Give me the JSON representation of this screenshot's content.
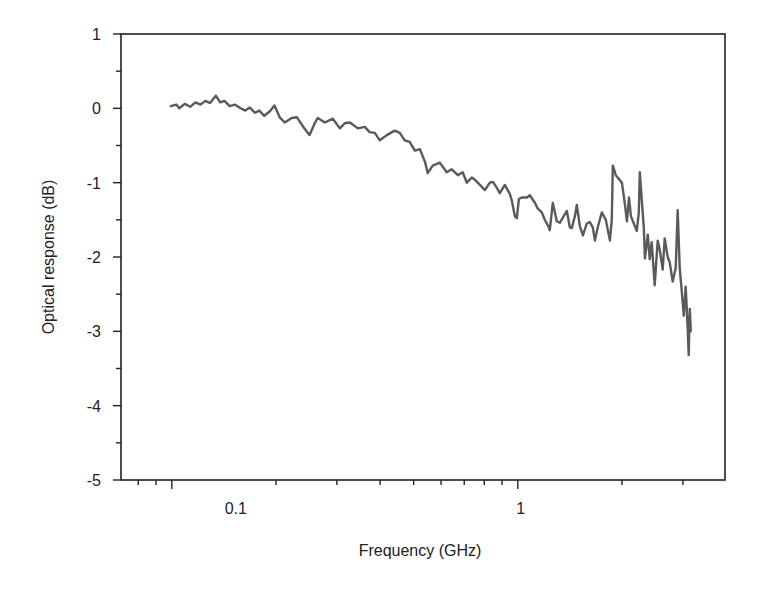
{
  "chart_data": {
    "type": "line",
    "title": "",
    "xlabel": "Frequency (GHz)",
    "ylabel": "Optical response (dB)",
    "xscale": "log",
    "xlim": [
      0.0713,
      3.97
    ],
    "ylim": [
      -5,
      1
    ],
    "grid": false,
    "legend": "none",
    "x_tick_labels": [
      {
        "value": 0.1,
        "label": "0.1"
      },
      {
        "value": 1,
        "label": "1"
      }
    ],
    "x_minor_ticks": [
      0.08,
      0.09,
      0.2,
      0.3,
      0.4,
      0.5,
      0.6,
      0.7,
      0.8,
      0.9,
      2,
      3
    ],
    "y_ticks": [
      1,
      0,
      -1,
      -2,
      -3,
      -4,
      -5
    ],
    "y_tick_labels": [
      "1",
      "0",
      "-1",
      "-2",
      "-3",
      "-4",
      "-5"
    ],
    "y_minor_ticks": [
      0.5,
      -0.5,
      -1.5,
      -2.5,
      -3.5,
      -4.5
    ],
    "line_color": "#5a5a5a",
    "series": [
      {
        "name": "Optical response",
        "points": [
          [
            0.0994,
            0.03
          ],
          [
            0.103,
            0.05
          ],
          [
            0.105,
            0.0
          ],
          [
            0.109,
            0.06
          ],
          [
            0.113,
            0.02
          ],
          [
            0.117,
            0.08
          ],
          [
            0.121,
            0.05
          ],
          [
            0.125,
            0.1
          ],
          [
            0.129,
            0.07
          ],
          [
            0.134,
            0.17
          ],
          [
            0.138,
            0.08
          ],
          [
            0.142,
            0.1
          ],
          [
            0.147,
            0.03
          ],
          [
            0.152,
            0.05
          ],
          [
            0.158,
            0.0
          ],
          [
            0.163,
            -0.03
          ],
          [
            0.168,
            0.01
          ],
          [
            0.174,
            -0.06
          ],
          [
            0.179,
            -0.03
          ],
          [
            0.185,
            -0.1
          ],
          [
            0.192,
            -0.04
          ],
          [
            0.198,
            0.04
          ],
          [
            0.205,
            -0.12
          ],
          [
            0.212,
            -0.19
          ],
          [
            0.222,
            -0.13
          ],
          [
            0.23,
            -0.12
          ],
          [
            0.239,
            -0.24
          ],
          [
            0.25,
            -0.36
          ],
          [
            0.259,
            -0.2
          ],
          [
            0.264,
            -0.13
          ],
          [
            0.277,
            -0.19
          ],
          [
            0.292,
            -0.14
          ],
          [
            0.306,
            -0.27
          ],
          [
            0.316,
            -0.2
          ],
          [
            0.327,
            -0.19
          ],
          [
            0.345,
            -0.27
          ],
          [
            0.361,
            -0.25
          ],
          [
            0.373,
            -0.32
          ],
          [
            0.386,
            -0.33
          ],
          [
            0.399,
            -0.43
          ],
          [
            0.418,
            -0.36
          ],
          [
            0.441,
            -0.3
          ],
          [
            0.456,
            -0.33
          ],
          [
            0.471,
            -0.43
          ],
          [
            0.487,
            -0.45
          ],
          [
            0.504,
            -0.57
          ],
          [
            0.521,
            -0.55
          ],
          [
            0.539,
            -0.72
          ],
          [
            0.549,
            -0.87
          ],
          [
            0.568,
            -0.77
          ],
          [
            0.595,
            -0.73
          ],
          [
            0.623,
            -0.86
          ],
          [
            0.644,
            -0.82
          ],
          [
            0.671,
            -0.9
          ],
          [
            0.693,
            -0.86
          ],
          [
            0.712,
            -1.0
          ],
          [
            0.736,
            -0.93
          ],
          [
            0.751,
            -0.96
          ],
          [
            0.777,
            -1.03
          ],
          [
            0.803,
            -1.1
          ],
          [
            0.83,
            -1.0
          ],
          [
            0.847,
            -0.99
          ],
          [
            0.87,
            -1.07
          ],
          [
            0.887,
            -1.14
          ],
          [
            0.917,
            -1.03
          ],
          [
            0.948,
            -1.15
          ],
          [
            0.961,
            -1.24
          ],
          [
            0.98,
            -1.45
          ],
          [
            0.993,
            -1.48
          ],
          [
            1.007,
            -1.22
          ],
          [
            1.027,
            -1.2
          ],
          [
            1.062,
            -1.2
          ],
          [
            1.083,
            -1.17
          ],
          [
            1.12,
            -1.27
          ],
          [
            1.142,
            -1.35
          ],
          [
            1.173,
            -1.4
          ],
          [
            1.197,
            -1.5
          ],
          [
            1.229,
            -1.6
          ],
          [
            1.237,
            -1.64
          ],
          [
            1.262,
            -1.27
          ],
          [
            1.296,
            -1.52
          ],
          [
            1.322,
            -1.54
          ],
          [
            1.357,
            -1.45
          ],
          [
            1.386,
            -1.38
          ],
          [
            1.413,
            -1.6
          ],
          [
            1.432,
            -1.61
          ],
          [
            1.462,
            -1.45
          ],
          [
            1.481,
            -1.3
          ],
          [
            1.511,
            -1.58
          ],
          [
            1.542,
            -1.71
          ],
          [
            1.583,
            -1.55
          ],
          [
            1.615,
            -1.53
          ],
          [
            1.647,
            -1.6
          ],
          [
            1.67,
            -1.78
          ],
          [
            1.703,
            -1.6
          ],
          [
            1.749,
            -1.4
          ],
          [
            1.796,
            -1.5
          ],
          [
            1.845,
            -1.78
          ],
          [
            1.869,
            -1.5
          ],
          [
            1.881,
            -0.77
          ],
          [
            1.919,
            -0.9
          ],
          [
            1.959,
            -0.95
          ],
          [
            1.999,
            -1.0
          ],
          [
            2.04,
            -1.3
          ],
          [
            2.067,
            -1.52
          ],
          [
            2.095,
            -1.2
          ],
          [
            2.123,
            -1.45
          ],
          [
            2.164,
            -1.55
          ],
          [
            2.207,
            -1.65
          ],
          [
            2.237,
            -1.4
          ],
          [
            2.252,
            -0.86
          ],
          [
            2.283,
            -1.25
          ],
          [
            2.313,
            -1.6
          ],
          [
            2.329,
            -2.02
          ],
          [
            2.375,
            -1.7
          ],
          [
            2.406,
            -2.03
          ],
          [
            2.438,
            -1.8
          ],
          [
            2.487,
            -2.38
          ],
          [
            2.537,
            -1.78
          ],
          [
            2.571,
            -1.9
          ],
          [
            2.623,
            -2.17
          ],
          [
            2.657,
            -1.75
          ],
          [
            2.711,
            -2.0
          ],
          [
            2.747,
            -2.07
          ],
          [
            2.803,
            -2.33
          ],
          [
            2.859,
            -2.15
          ],
          [
            2.898,
            -1.37
          ],
          [
            2.937,
            -2.15
          ],
          [
            2.977,
            -2.45
          ],
          [
            3.017,
            -2.79
          ],
          [
            3.057,
            -2.4
          ],
          [
            3.098,
            -2.96
          ],
          [
            3.119,
            -3.32
          ],
          [
            3.14,
            -2.7
          ],
          [
            3.161,
            -3.0
          ]
        ]
      }
    ]
  }
}
